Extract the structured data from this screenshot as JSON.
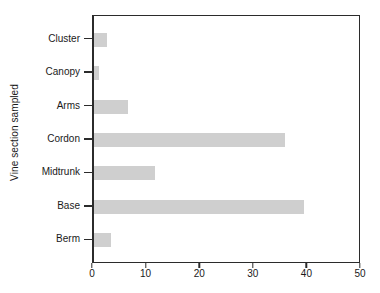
{
  "chart_data": {
    "type": "bar",
    "orientation": "horizontal",
    "title": "",
    "xlabel": "",
    "ylabel": "Vine section sampled",
    "categories": [
      "Cluster",
      "Canopy",
      "Arms",
      "Cordon",
      "Midtrunk",
      "Base",
      "Berm"
    ],
    "values": [
      2.4,
      0.9,
      6.3,
      35.7,
      11.4,
      39.2,
      3.1
    ],
    "xlim": [
      0,
      50
    ],
    "xticks": [
      0,
      10,
      20,
      30,
      40,
      50
    ],
    "xtick_labels": [
      "0",
      "10",
      "20",
      "30",
      "40",
      "50"
    ],
    "grid": false,
    "legend": null,
    "bar_color": "#cfcfcf",
    "axis_color": "#2b2b2b"
  },
  "axes": {
    "y_title": "Vine section sampled"
  }
}
